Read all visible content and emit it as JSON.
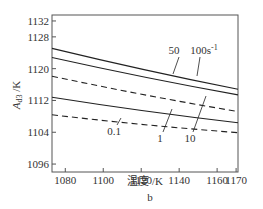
{
  "chart_data": {
    "type": "line",
    "title": "",
    "subfigure_label": "b",
    "xlabel": "温度 /K",
    "ylabel": "A_d3 /K",
    "ylabel_main": "A",
    "ylabel_sub": "d3",
    "ylabel_unit": " /K",
    "xlim": [
      1073,
      1171
    ],
    "ylim": [
      1094,
      1133.5
    ],
    "xticks": [
      1080,
      1100,
      1120,
      1140,
      1160,
      1170
    ],
    "yticks": [
      1096,
      1104,
      1112,
      1120,
      1128,
      1132
    ],
    "grid": false,
    "series": [
      {
        "name": "100s⁻¹",
        "label": "100s",
        "label_sup": "-1",
        "style": "solid",
        "x": [
          1073,
          1171
        ],
        "y": [
          1125.1,
          1114.8
        ]
      },
      {
        "name": "50",
        "label": "50",
        "style": "solid",
        "x": [
          1073,
          1171
        ],
        "y": [
          1122.8,
          1113.4
        ]
      },
      {
        "name": "10",
        "label": "10",
        "style": "dashed",
        "x": [
          1073,
          1171
        ],
        "y": [
          1118.1,
          1109.2
        ]
      },
      {
        "name": "1",
        "label": "1",
        "style": "solid",
        "x": [
          1073,
          1171
        ],
        "y": [
          1112.8,
          1106.4
        ]
      },
      {
        "name": "0.1",
        "label": "0.1",
        "style": "dashed",
        "x": [
          1073,
          1171
        ],
        "y": [
          1108.4,
          1103.9
        ]
      }
    ]
  },
  "colors": {
    "line": "#222222",
    "axis": "#555555",
    "text": "#333333"
  }
}
